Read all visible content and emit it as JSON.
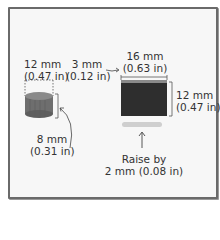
{
  "diagram": {
    "cylinder": {
      "diameter_mm": "12 mm",
      "diameter_in": "(0.47 in)",
      "height_mm": "8 mm",
      "height_in": "(0.31 in)",
      "color": "#6e6e6e"
    },
    "gap": {
      "mm": "3 mm",
      "in": "(0.12 in)"
    },
    "block": {
      "width_mm": "16 mm",
      "width_in": "(0.63 in)",
      "height_mm": "12 mm",
      "height_in": "(0.47 in)",
      "color": "#2e2e2e"
    },
    "raise": {
      "line1": "Raise by",
      "line2": "2 mm (0.08 in)"
    }
  }
}
